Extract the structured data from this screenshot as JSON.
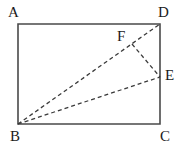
{
  "figure": {
    "background_color": "#ffffff",
    "outline_color": "#4a4a4a",
    "dash_color": "#3a3a3a",
    "label_color": "#1a1a1a",
    "rectangle": {
      "name": "ABCD",
      "corners": {
        "A": {
          "x": 18,
          "y": 24
        },
        "D": {
          "x": 160,
          "y": 24
        },
        "C": {
          "x": 160,
          "y": 124
        },
        "B": {
          "x": 18,
          "y": 124
        }
      },
      "stroke_width": 1.6,
      "style": "solid"
    },
    "points": {
      "F": {
        "x": 132,
        "y": 44
      },
      "E": {
        "x": 160,
        "y": 77
      }
    },
    "dashed_segments": [
      {
        "name": "BD",
        "from": "B",
        "to": "D",
        "x1": 18,
        "y1": 124,
        "x2": 160,
        "y2": 24
      },
      {
        "name": "BE",
        "from": "B",
        "to": "E",
        "x1": 18,
        "y1": 124,
        "x2": 160,
        "y2": 77
      },
      {
        "name": "FE",
        "from": "F",
        "to": "E",
        "x1": 132,
        "y1": 44,
        "x2": 160,
        "y2": 77
      }
    ],
    "labels": [
      {
        "key": "A",
        "text": "A",
        "x": 8,
        "y": 5
      },
      {
        "key": "D",
        "text": "D",
        "x": 158,
        "y": 5
      },
      {
        "key": "F",
        "text": "F",
        "x": 117,
        "y": 29
      },
      {
        "key": "E",
        "text": "E",
        "x": 165,
        "y": 68
      },
      {
        "key": "B",
        "text": "B",
        "x": 10,
        "y": 129
      },
      {
        "key": "C",
        "text": "C",
        "x": 160,
        "y": 129
      }
    ]
  }
}
